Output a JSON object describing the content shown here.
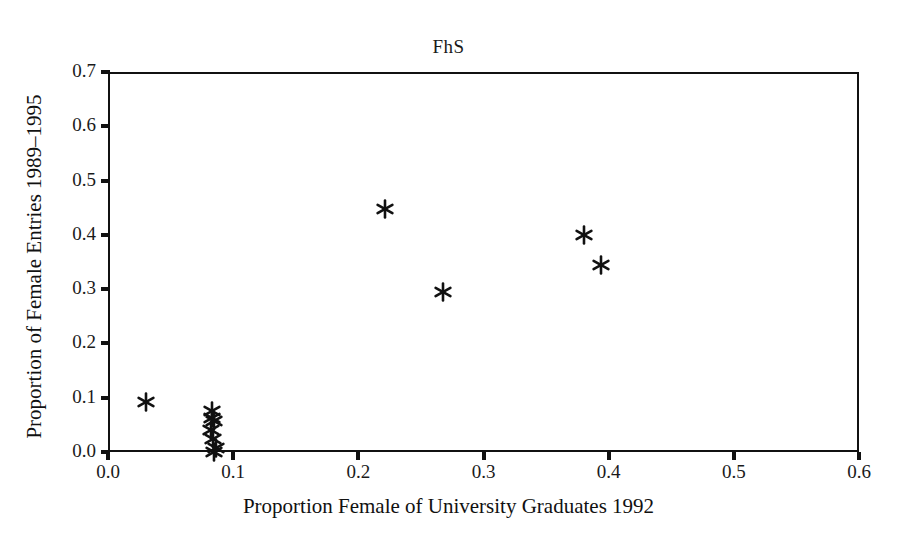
{
  "chart_data": {
    "type": "scatter",
    "title": "FhS",
    "xlabel": "Proportion Female of University Graduates 1992",
    "ylabel": "Proportion of Female Entries 1989–1995",
    "xlim": [
      0.0,
      0.6
    ],
    "ylim": [
      0.0,
      0.7
    ],
    "xticks": [
      "0.0",
      "0.1",
      "0.2",
      "0.3",
      "0.4",
      "0.5",
      "0.6"
    ],
    "xtick_values": [
      0.0,
      0.1,
      0.2,
      0.3,
      0.4,
      0.5,
      0.6
    ],
    "yticks": [
      "0.0",
      "0.1",
      "0.2",
      "0.3",
      "0.4",
      "0.5",
      "0.6",
      "0.7"
    ],
    "ytick_values": [
      0.0,
      0.1,
      0.2,
      0.3,
      0.4,
      0.5,
      0.6,
      0.7
    ],
    "grid": false,
    "legend": null,
    "marker": "asterisk",
    "marker_color": "#111111",
    "points": [
      {
        "x": 0.03,
        "y": 0.092
      },
      {
        "x": 0.083,
        "y": 0.075
      },
      {
        "x": 0.083,
        "y": 0.062
      },
      {
        "x": 0.085,
        "y": 0.058
      },
      {
        "x": 0.082,
        "y": 0.04
      },
      {
        "x": 0.084,
        "y": 0.024
      },
      {
        "x": 0.086,
        "y": 0.007
      },
      {
        "x": 0.085,
        "y": 0.0
      },
      {
        "x": 0.221,
        "y": 0.448
      },
      {
        "x": 0.268,
        "y": 0.294
      },
      {
        "x": 0.38,
        "y": 0.399
      },
      {
        "x": 0.394,
        "y": 0.345
      }
    ]
  },
  "figure": {
    "background": "#ffffff",
    "axis_color": "#111111",
    "title": "FhS"
  }
}
